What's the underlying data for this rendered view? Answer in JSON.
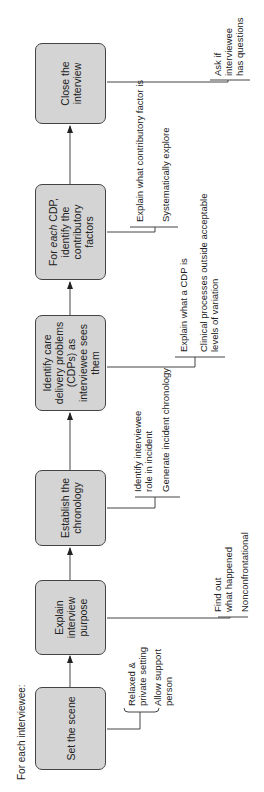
{
  "diagram": {
    "heading": "For each interviewee:",
    "steps": [
      {
        "label": "Set the scene",
        "notes": [
          "Relaxed &\nprivate setting",
          "Allow support\nperson"
        ]
      },
      {
        "label": "Explain interview purpose",
        "notes": [
          "Find out\nwhat happened",
          "Nonconfrontational"
        ]
      },
      {
        "label": "Establish the chronology",
        "notes": [
          "Identify interviewee\nrole in incident",
          "Generate incident chronology"
        ]
      },
      {
        "label": "Identify care delivery problems (CDPs) as interviewee sees them",
        "notes": [
          "Explain what a CDP is",
          "Clinical processes outside acceptable\nlevels of variation"
        ]
      },
      {
        "label_prefix": "For ",
        "label_emphasis": "each",
        "label_suffix": " CDP, identify the contributory factors",
        "notes": [
          "Explain what contributory factor is",
          "Systematically explore"
        ]
      },
      {
        "label": "Close the interview",
        "notes": [
          "Ask if\ninterviewee\nhas questions"
        ]
      }
    ],
    "colors": {
      "box_fill": "#d4d4d4",
      "box_border": "#444444",
      "line": "#444444"
    }
  }
}
